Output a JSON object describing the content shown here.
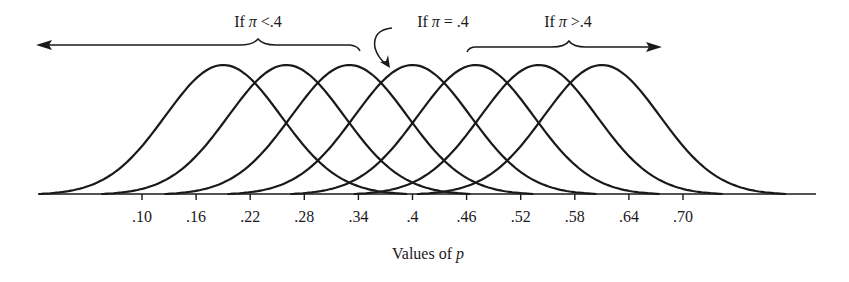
{
  "chart_data": {
    "type": "line",
    "title": "",
    "xlabel": "Values of p",
    "xlabel_prefix": "Values of ",
    "xlabel_var": "p",
    "ylabel": "",
    "x_ticks": [
      0.1,
      0.16,
      0.22,
      0.28,
      0.34,
      0.4,
      0.46,
      0.52,
      0.58,
      0.64,
      0.7
    ],
    "x_tick_labels": [
      ".10",
      ".16",
      ".22",
      ".28",
      ".34",
      ".4",
      ".46",
      ".52",
      ".58",
      ".64",
      ".70"
    ],
    "grid": false,
    "legend": "none",
    "series": [
      {
        "name": "sampling distribution 1",
        "center": 0.19
      },
      {
        "name": "sampling distribution 2",
        "center": 0.26
      },
      {
        "name": "sampling distribution 3",
        "center": 0.33
      },
      {
        "name": "sampling distribution (pi = .4)",
        "center": 0.4
      },
      {
        "name": "sampling distribution 5",
        "center": 0.47
      },
      {
        "name": "sampling distribution 6",
        "center": 0.54
      },
      {
        "name": "sampling distribution 7",
        "center": 0.61
      }
    ],
    "annotations": [
      {
        "text": "If π <.4",
        "prefix": "If ",
        "var": "π",
        "suffix": " <.4",
        "arrow": "left"
      },
      {
        "text": "If π = .4",
        "prefix": "If ",
        "var": "π",
        "suffix": " = .4",
        "arrow": "curved-down"
      },
      {
        "text": "If π >.4",
        "prefix": "If ",
        "var": "π",
        "suffix": " >.4",
        "arrow": "right"
      }
    ]
  },
  "colors": {
    "ink": "#1a1a1a",
    "background": "#ffffff"
  }
}
